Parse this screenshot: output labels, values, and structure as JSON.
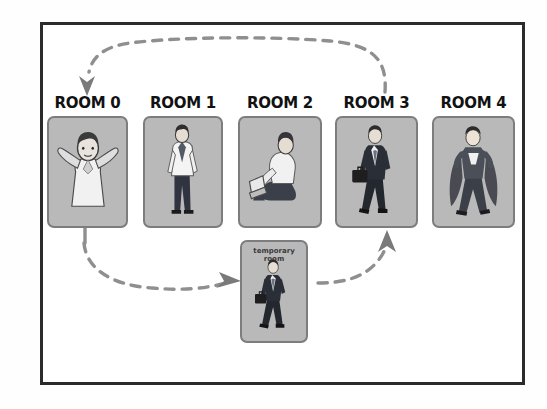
{
  "diagram": {
    "title_visible": false,
    "frame": {
      "border_color": "#2b2b2b"
    },
    "colors": {
      "room_fill": "#b9b9b9",
      "room_border": "#7d7d7d",
      "arrow": "#8c8c8c",
      "arrow_dark": "#6e6e6e",
      "text": "#111111",
      "frame": "#2b2b2b",
      "background": "#ffffff"
    },
    "rooms": [
      {
        "label": "ROOM 0",
        "figure": "person-hands-behind-head-icon",
        "x": 47,
        "y": 116,
        "w": 81,
        "h": 112
      },
      {
        "label": "ROOM 1",
        "figure": "person-standing-white-shirt-icon",
        "x": 143,
        "y": 116,
        "w": 80,
        "h": 112
      },
      {
        "label": "ROOM 2",
        "figure": "person-sitting-with-laptop-icon",
        "x": 238,
        "y": 116,
        "w": 84,
        "h": 112
      },
      {
        "label": "ROOM 3",
        "figure": "person-walking-with-briefcase-icon",
        "x": 335,
        "y": 116,
        "w": 83,
        "h": 112
      },
      {
        "label": "ROOM 4",
        "figure": "superhero-with-cape-icon",
        "x": 432,
        "y": 116,
        "w": 83,
        "h": 112
      }
    ],
    "temporary_room": {
      "label_line1": "temporary",
      "label_line2": "room",
      "figure": "person-walking-with-briefcase-icon",
      "x": 240,
      "y": 240,
      "w": 68,
      "h": 103
    },
    "arrows": [
      {
        "name": "return-to-room-0",
        "description": "dashed curve from room 3 area arcing over the top to room 0, arrowhead pointing down into ROOM 0"
      },
      {
        "name": "room-0-to-temporary-room",
        "description": "dashed curve from below room 0 sweeping right, arrowhead pointing right into temporary room"
      },
      {
        "name": "temporary-room-to-room-3",
        "description": "dashed curve from right of temporary room curving up, arrowhead pointing up into ROOM 3"
      }
    ]
  }
}
